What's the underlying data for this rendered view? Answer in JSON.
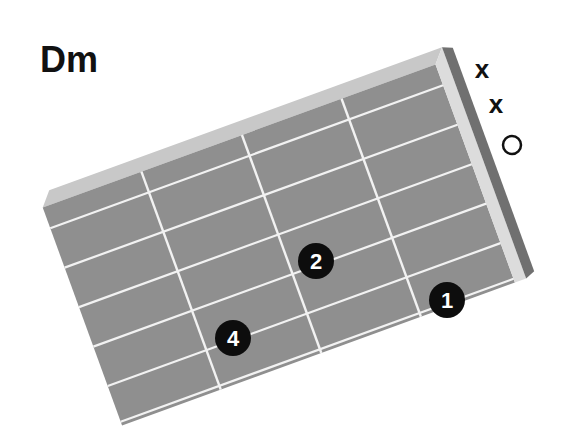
{
  "chord": {
    "name": "Dm",
    "fingering": "xx0231"
  },
  "colors": {
    "board": "#8f8f8f",
    "bevel": "#c8c8c8",
    "nut_face": "#dcdcdc",
    "nut_side": "#707070",
    "lines": "#f2f2f2",
    "dot": "#0d0d0d",
    "dot_text": "#ffffff"
  },
  "strings": [
    {
      "name": "E",
      "marker": "x"
    },
    {
      "name": "A",
      "marker": "x"
    },
    {
      "name": "D",
      "marker": "o"
    },
    {
      "name": "G",
      "marker": ""
    },
    {
      "name": "B",
      "marker": ""
    },
    {
      "name": "e",
      "marker": ""
    }
  ],
  "fingers": [
    {
      "string": "G",
      "fret": 2,
      "label": "2"
    },
    {
      "string": "B",
      "fret": 3,
      "label": "4"
    },
    {
      "string": "e",
      "fret": 1,
      "label": "1"
    }
  ]
}
